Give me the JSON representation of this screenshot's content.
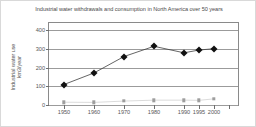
{
  "chart_data": {
    "type": "line",
    "title": "Industrial water withdrawals and consumption in North America over 50 years",
    "xlabel": "",
    "ylabel": "Industrial water use km3/year",
    "ylabel_line1": "Industrial water use",
    "ylabel_line2": "km3/year",
    "categories": [
      "1950",
      "1960",
      "1970",
      "1980",
      "1990",
      "1995",
      "2000"
    ],
    "x": [
      1950,
      1960,
      1970,
      1980,
      1990,
      1995,
      2000
    ],
    "xlim": [
      1945,
      2008
    ],
    "ylim": [
      0,
      440
    ],
    "yticks": [
      0,
      100,
      200,
      300,
      400
    ],
    "ytick_labels": [
      "0",
      "100",
      "200",
      "300",
      "400"
    ],
    "grid": "horizontal",
    "legend": "none",
    "series": [
      {
        "name": "Industrial water withdrawals",
        "marker": "diamond",
        "color": "#111111",
        "values": [
          110,
          172,
          260,
          315,
          280,
          295,
          302
        ]
      },
      {
        "name": "Industrial water consumption",
        "marker": "square",
        "color": "#9e9e9e",
        "values": [
          15,
          14,
          21,
          26,
          26,
          25,
          33
        ]
      }
    ],
    "extra_xticks_unlabeled": [
      2005
    ]
  }
}
